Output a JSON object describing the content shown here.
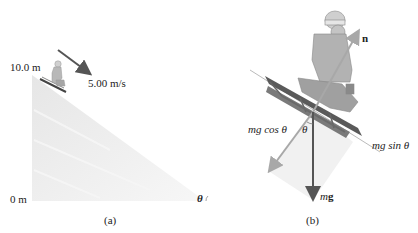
{
  "figure": {
    "panel_a": {
      "caption": "(a)",
      "height_top_label": "10.0 m",
      "height_bottom_label": "0 m",
      "velocity_label": "5.00 m/s",
      "angle_label": "θ"
    },
    "panel_b": {
      "caption": "(b)",
      "normal_force_label": "n",
      "weight_label_m": "m",
      "weight_label_g": "g",
      "perp_component_label": "mg cos θ",
      "parallel_component_label": "mg sin θ",
      "angle_label": "θ"
    },
    "colors": {
      "slope_fill": "#ececec",
      "arrow_dark": "#555555",
      "arrow_light": "#a8a8a8",
      "shade": "#f0f0f0"
    }
  }
}
